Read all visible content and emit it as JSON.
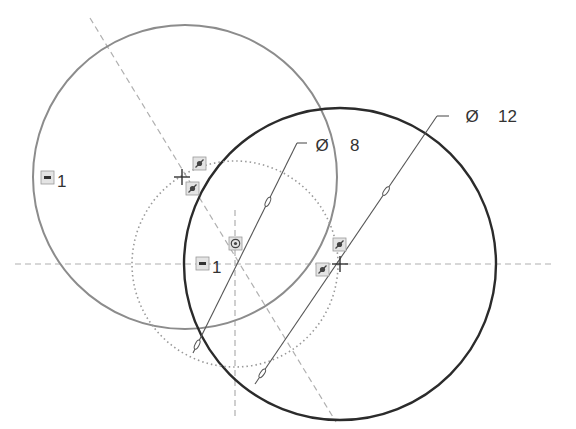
{
  "sketch": {
    "colors": {
      "background": "#ffffff",
      "construction_circle": "#8c8c8c",
      "active_circle": "#2b2b2b",
      "centerline": "#b0b0b0",
      "dimension": "#555555",
      "relation_badge_bg": "#e4e4e4",
      "relation_badge_border": "#9a9a9a"
    },
    "centerlines": {
      "horizontal": {
        "x1": 15,
        "y1": 264,
        "x2": 552,
        "y2": 264
      },
      "vertical": {
        "x1": 235,
        "y1": 210,
        "x2": 235,
        "y2": 420
      },
      "diagonal": {
        "x1": 90,
        "y1": 18,
        "x2": 336,
        "y2": 422
      }
    },
    "circles": [
      {
        "name": "gray-circle",
        "cx": 185,
        "cy": 177,
        "r": 152,
        "style": "solid-gray"
      },
      {
        "name": "dark-circle",
        "cx": 340,
        "cy": 264,
        "r": 156,
        "style": "solid-dark"
      },
      {
        "name": "dotted-circle",
        "cx": 235,
        "cy": 264,
        "r": 103,
        "style": "dotted"
      }
    ],
    "dimensions": [
      {
        "name": "diameter-8",
        "symbol": "Ø",
        "value": "8",
        "line": {
          "x1": 193,
          "y1": 353,
          "x2": 297,
          "y2": 143
        },
        "leader": {
          "x2": 307,
          "y2": 143
        },
        "symbol_pos": {
          "x": 322,
          "y": 151
        },
        "value_pos": {
          "x": 350,
          "y": 151
        }
      },
      {
        "name": "diameter-12",
        "symbol": "Ø",
        "value": "12",
        "line": {
          "x1": 255,
          "y1": 384,
          "x2": 437,
          "y2": 116
        },
        "leader": {
          "x2": 449,
          "y2": 116
        },
        "symbol_pos": {
          "x": 472,
          "y": 122
        },
        "value_pos": {
          "x": 498,
          "y": 122
        }
      }
    ],
    "equal_labels": [
      {
        "name": "equal-label-left",
        "text": "1",
        "badge_x": 41,
        "badge_y": 171,
        "text_x": 57,
        "text_y": 187
      },
      {
        "name": "equal-label-center",
        "text": "1",
        "badge_x": 196,
        "badge_y": 257,
        "text_x": 212,
        "text_y": 273
      }
    ],
    "relation_badges": [
      {
        "name": "tangent-badge-1",
        "x": 193,
        "y": 157
      },
      {
        "name": "tangent-badge-2",
        "x": 186,
        "y": 182
      },
      {
        "name": "tangent-badge-3",
        "x": 333,
        "y": 238
      },
      {
        "name": "tangent-badge-4",
        "x": 316,
        "y": 263
      }
    ],
    "coincident_badge": {
      "name": "coincident-badge",
      "x": 229,
      "y": 237
    },
    "center_marks": [
      {
        "name": "center-mark-gray",
        "x": 182,
        "y": 177
      },
      {
        "name": "center-mark-dark",
        "x": 340,
        "y": 264
      }
    ]
  }
}
